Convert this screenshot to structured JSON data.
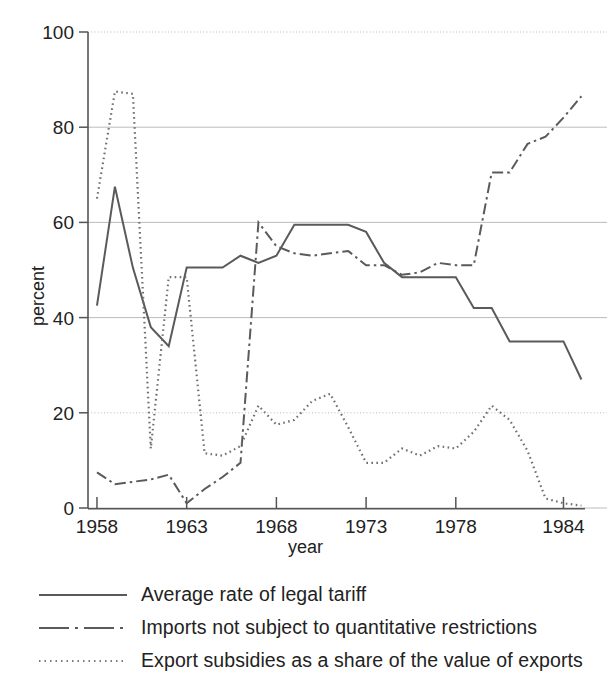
{
  "chart_data": {
    "type": "line",
    "title": "",
    "xlabel": "year",
    "ylabel": "percent",
    "xlim": [
      1957.5,
      1985.2
    ],
    "ylim": [
      0,
      100
    ],
    "xticks": [
      1958,
      1963,
      1968,
      1973,
      1978,
      1984
    ],
    "xtick_labels": [
      "1958",
      "1963",
      "1968",
      "1973",
      "1978",
      "1984"
    ],
    "yticks": [
      0,
      20,
      40,
      60,
      80,
      100
    ],
    "ytick_labels": [
      "0",
      "20",
      "40",
      "60",
      "80",
      "100"
    ],
    "grid": "horizontal",
    "legend_position": "below",
    "line_color": "#5a5a5a",
    "series": [
      {
        "name": "Average rate of legal tariff",
        "style": "solid",
        "x": [
          1958,
          1959,
          1960,
          1961,
          1962,
          1963,
          1964,
          1965,
          1966,
          1967,
          1968,
          1969,
          1970,
          1971,
          1972,
          1973,
          1974,
          1975,
          1976,
          1977,
          1978,
          1979,
          1980,
          1981,
          1982,
          1983,
          1984,
          1985
        ],
        "values": [
          42.5,
          67.5,
          50.5,
          38.0,
          34.0,
          50.5,
          50.5,
          50.5,
          53.0,
          51.5,
          53.0,
          59.5,
          59.5,
          59.5,
          59.5,
          58.0,
          51.5,
          48.5,
          48.5,
          48.5,
          48.5,
          42.0,
          42.0,
          35.0,
          35.0,
          35.0,
          35.0,
          27.0
        ]
      },
      {
        "name": "Imports not subject to quantitative restrictions",
        "style": "dashdot",
        "x": [
          1958,
          1959,
          1960,
          1961,
          1962,
          1963,
          1964,
          1965,
          1966,
          1967,
          1968,
          1969,
          1970,
          1971,
          1972,
          1973,
          1974,
          1975,
          1976,
          1977,
          1978,
          1979,
          1980,
          1981,
          1982,
          1983,
          1984,
          1985
        ],
        "values": [
          7.5,
          5.0,
          5.5,
          6.0,
          7.0,
          1.0,
          4.0,
          6.5,
          9.5,
          60.0,
          55.0,
          53.5,
          53.0,
          53.5,
          54.0,
          51.0,
          51.0,
          49.0,
          49.5,
          51.5,
          51.0,
          51.0,
          70.5,
          70.5,
          76.5,
          78.0,
          82.0,
          86.5
        ]
      },
      {
        "name": "Export subsidies as a share of the value of exports",
        "style": "dotted",
        "x": [
          1958,
          1959,
          1960,
          1961,
          1962,
          1963,
          1964,
          1965,
          1966,
          1967,
          1968,
          1969,
          1970,
          1971,
          1972,
          1973,
          1974,
          1975,
          1976,
          1977,
          1978,
          1979,
          1980,
          1981,
          1982,
          1983,
          1984,
          1985
        ],
        "values": [
          65.0,
          87.5,
          87.0,
          12.5,
          48.5,
          48.5,
          11.5,
          11.0,
          13.0,
          21.5,
          17.5,
          18.5,
          22.5,
          24.0,
          17.0,
          9.5,
          9.5,
          12.5,
          11.0,
          13.0,
          12.5,
          16.0,
          21.5,
          18.5,
          12.0,
          2.0,
          1.0,
          0.5
        ]
      }
    ]
  },
  "axis": {
    "y_title": "percent",
    "x_title": "year"
  },
  "legend": {
    "items": [
      {
        "label": "Average rate of legal tariff",
        "style": "solid",
        "key_name": "legend-key-solid"
      },
      {
        "label": "Imports not subject to quantitative restrictions",
        "style": "dashdot",
        "key_name": "legend-key-dashdot"
      },
      {
        "label": "Export subsidies as a share of the value of exports",
        "style": "dotted",
        "key_name": "legend-key-dotted"
      }
    ]
  }
}
